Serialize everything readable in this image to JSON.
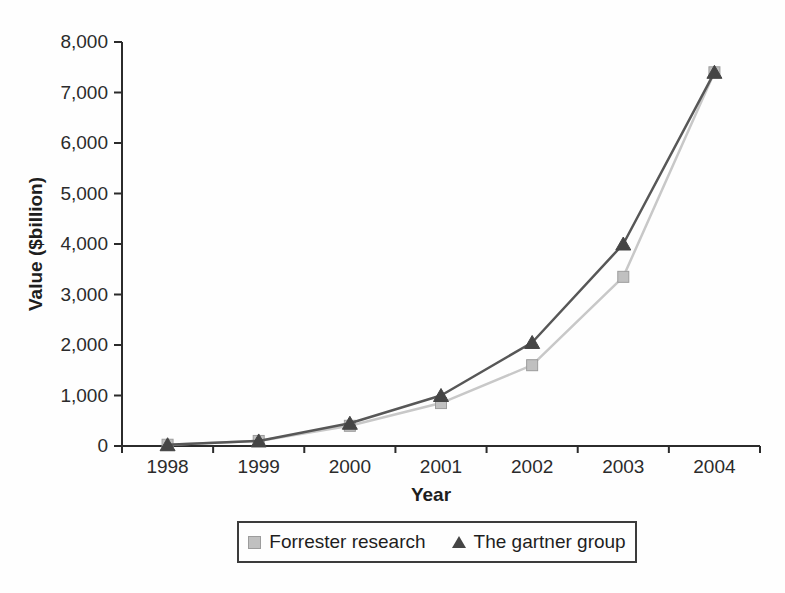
{
  "page": {
    "background": "#fefefe",
    "axis_color": "#2b2b2b",
    "legend_border_color": "#3c3c3c"
  },
  "chart_data": {
    "type": "line",
    "title": "",
    "xlabel": "Year",
    "ylabel": "Value ($billion)",
    "categories": [
      "1998",
      "1999",
      "2000",
      "2001",
      "2002",
      "2003",
      "2004"
    ],
    "series": [
      {
        "name": "Forrester research",
        "marker": "square",
        "values": [
          25,
          100,
          400,
          850,
          1600,
          3350,
          7400
        ],
        "line_color": "#c8c8c8",
        "marker_color": "#c0c0c0",
        "marker_edge": "#9c9c9c"
      },
      {
        "name": "The gartner group",
        "marker": "triangle",
        "values": [
          25,
          100,
          450,
          1000,
          2050,
          4000,
          7400
        ],
        "line_color": "#575757",
        "marker_color": "#454545",
        "marker_edge": "#454545"
      }
    ],
    "ylim": [
      0,
      8000
    ],
    "ytick_step": 1000,
    "ytick_labels": [
      "0",
      "1,000",
      "2,000",
      "3,000",
      "4,000",
      "5,000",
      "6,000",
      "7,000",
      "8,000"
    ],
    "grid": false,
    "legend_position": "bottom"
  }
}
